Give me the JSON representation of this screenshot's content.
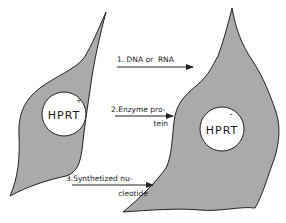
{
  "diagram": {
    "colors": {
      "cell_fill": "#aaaaaa",
      "cell_stroke": "#222222",
      "nucleus_fill": "#ffffff",
      "text": "#1a1a1a",
      "arrow": "#222222"
    },
    "donor_cell": {
      "nucleus_label": "HPRT",
      "nucleus_sign": "+"
    },
    "recipient_cell": {
      "nucleus_label": "HPRT",
      "nucleus_sign": "-"
    },
    "arrows": [
      {
        "id": 1,
        "line1": "1. DNA or  RNA",
        "line2": ""
      },
      {
        "id": 2,
        "line1": "2.Enzyme pro-",
        "line2": "tein"
      },
      {
        "id": 3,
        "line1": "3.Synthetized nu-",
        "line2": "cleotide"
      }
    ]
  }
}
